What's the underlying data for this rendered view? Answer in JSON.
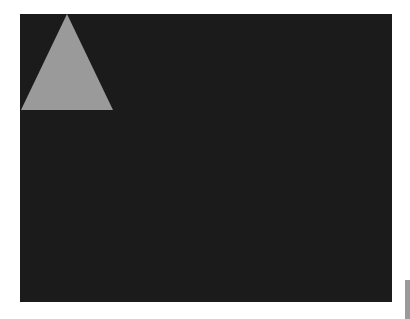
{
  "canvas": {
    "background": "#1b1b1b",
    "shapes": [
      {
        "type": "triangle",
        "color": "#9a9a9a",
        "points": "47,0 1,96 93,96"
      }
    ]
  },
  "scrollbar": {
    "thumb_color": "#9a9a9a"
  }
}
